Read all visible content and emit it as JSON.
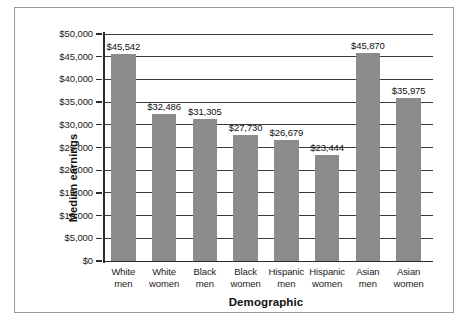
{
  "figure": {
    "top_edge_artifact": "·"
  },
  "chart_data": {
    "type": "bar",
    "title": "",
    "xlabel": "Demographic",
    "ylabel": "Median earnings",
    "categories": [
      "White men",
      "White women",
      "Black men",
      "Black women",
      "Hispanic men",
      "Hispanic women",
      "Asian men",
      "Asian women"
    ],
    "category_lines": [
      [
        "White",
        "men"
      ],
      [
        "White",
        "women"
      ],
      [
        "Black",
        "men"
      ],
      [
        "Black",
        "women"
      ],
      [
        "Hispanic",
        "men"
      ],
      [
        "Hispanic",
        "women"
      ],
      [
        "Asian",
        "men"
      ],
      [
        "Asian",
        "women"
      ]
    ],
    "values": [
      45542,
      32486,
      31305,
      27730,
      26679,
      23444,
      45870,
      35975
    ],
    "value_labels": [
      "$45,542",
      "$32,486",
      "$31,305",
      "$27,730",
      "$26,679",
      "$23,444",
      "$45,870",
      "$35,975"
    ],
    "ylim": [
      0,
      50000
    ],
    "ytick_values": [
      0,
      5000,
      10000,
      15000,
      20000,
      25000,
      30000,
      35000,
      40000,
      45000,
      50000
    ],
    "ytick_labels": [
      "$0",
      "$5,000",
      "$10,000",
      "$15,000",
      "$20,000",
      "$25,000",
      "$30,000",
      "$35,000",
      "$40,000",
      "$45,000",
      "$50,000"
    ],
    "grid": true,
    "grid_axis": "y",
    "legend": false,
    "bar_color": "#8c8c8c",
    "axis_color": "#2b2b2b",
    "grid_color": "#3a3a3a",
    "background": "#ffffff"
  }
}
